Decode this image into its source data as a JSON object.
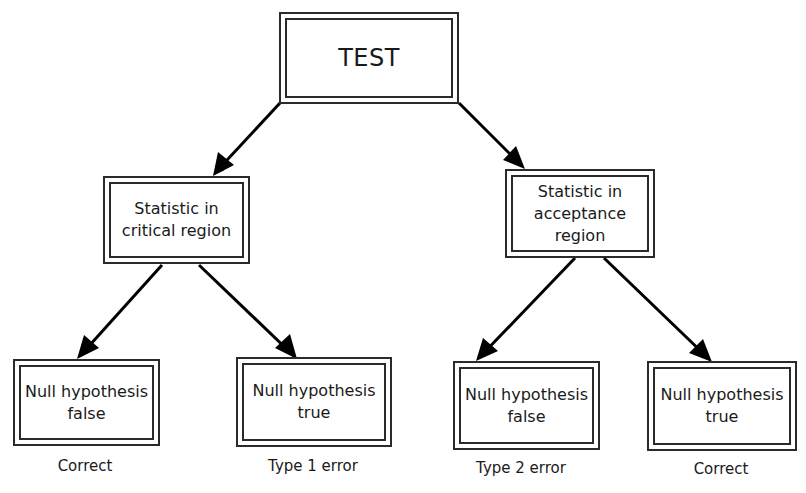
{
  "diagram": {
    "type": "decision-tree",
    "root": {
      "id": "test",
      "label": "TEST"
    },
    "level1": [
      {
        "id": "critical",
        "label": "Statistic in\ncritical region"
      },
      {
        "id": "acceptance",
        "label": "Statistic in\nacceptance\nregion"
      }
    ],
    "level2": [
      {
        "id": "crit-false",
        "parent": "critical",
        "label": "Null hypothesis\nfalse",
        "outcome": "Correct"
      },
      {
        "id": "crit-true",
        "parent": "critical",
        "label": "Null hypothesis\ntrue",
        "outcome": "Type 1 error"
      },
      {
        "id": "acc-false",
        "parent": "acceptance",
        "label": "Null hypothesis\nfalse",
        "outcome": "Type 2 error"
      },
      {
        "id": "acc-true",
        "parent": "acceptance",
        "label": "Null hypothesis\ntrue",
        "outcome": "Correct"
      }
    ],
    "edges": [
      [
        "test",
        "critical"
      ],
      [
        "test",
        "acceptance"
      ],
      [
        "critical",
        "crit-false"
      ],
      [
        "critical",
        "crit-true"
      ],
      [
        "acceptance",
        "acc-false"
      ],
      [
        "acceptance",
        "acc-true"
      ]
    ],
    "colors": {
      "stroke": "#2a2a2a",
      "arrow": "#000000",
      "background": "#ffffff"
    }
  }
}
